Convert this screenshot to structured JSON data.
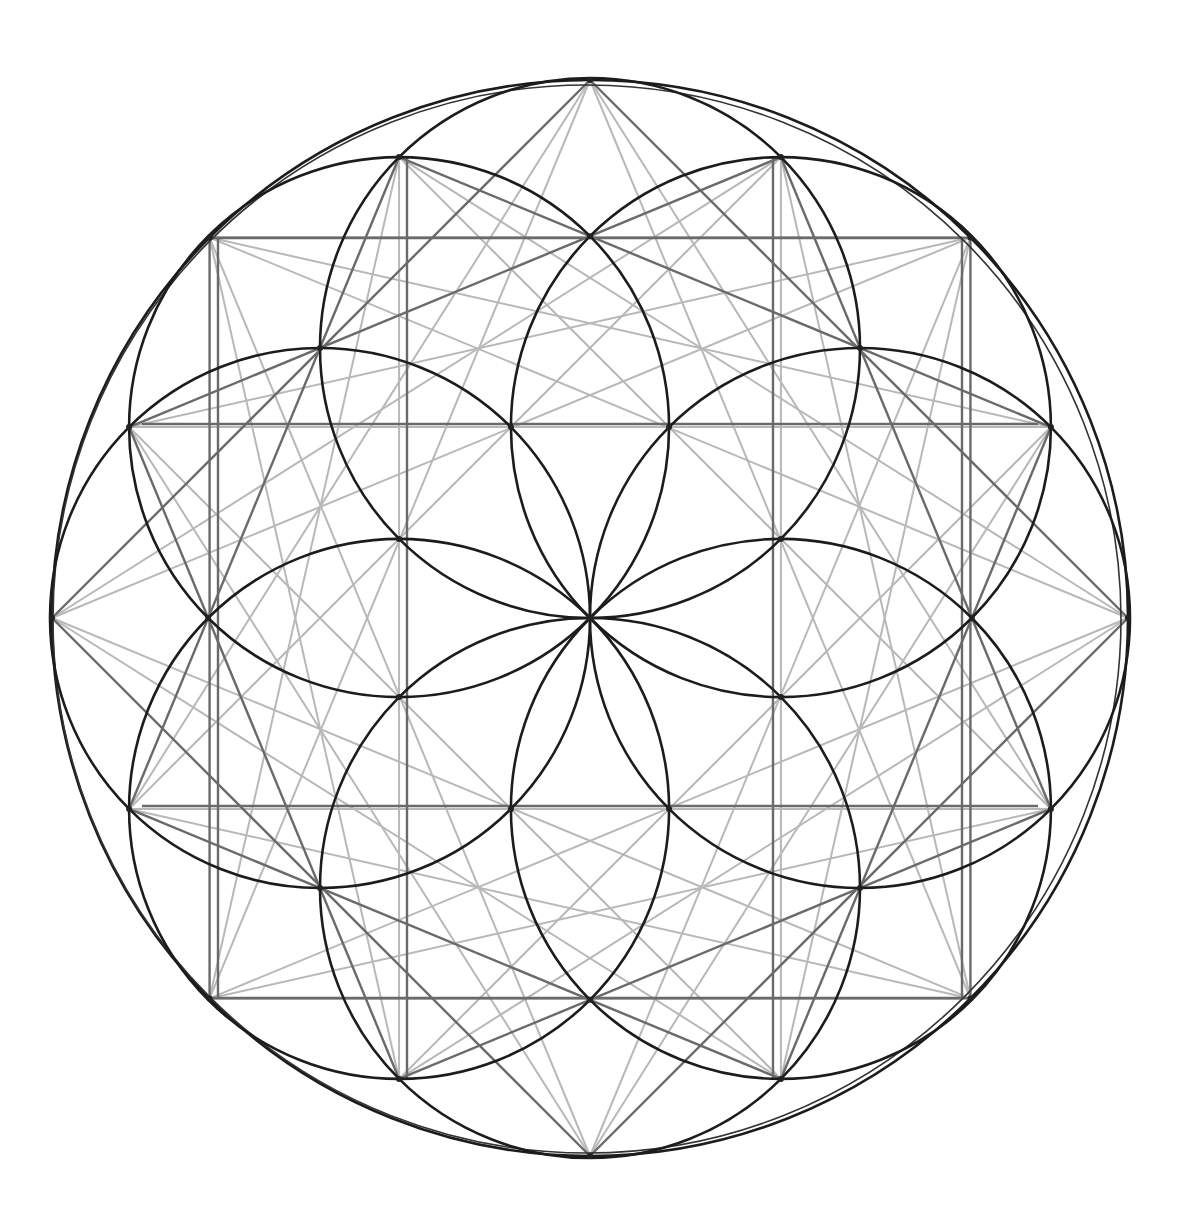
{
  "figure": {
    "center": [
      590,
      618
    ],
    "outer_radius": 538,
    "inner_radius": 270,
    "inner_circle_count": 8,
    "colors": {
      "background": "#ffffff",
      "circle_stroke": "#1a1a1a",
      "construction_stroke": "#6e6e6e",
      "faint_stroke": "#b5b5b5"
    },
    "grid_lines": {
      "vertical_x": [
        218,
        407,
        773,
        962
      ],
      "horizontal_y": [
        238,
        424,
        806,
        998
      ]
    }
  }
}
